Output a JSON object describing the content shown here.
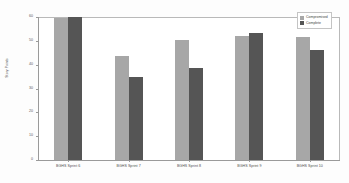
{
  "chart_data": {
    "type": "bar",
    "title": "",
    "subtitle": "",
    "xlabel": "",
    "ylabel": "Story Points",
    "ylim": [
      0,
      60
    ],
    "yticks": [
      0,
      10,
      20,
      30,
      40,
      50,
      60
    ],
    "ytick_labels": [
      "0",
      "10",
      "20",
      "30",
      "40",
      "50",
      "60"
    ],
    "grid": false,
    "legend_position": "upper-right",
    "categories": [
      "BGHS Sprint 6",
      "BGHS Sprint 7",
      "BGHS Sprint 8",
      "BGHS Sprint 9",
      "BGHS Sprint 10"
    ],
    "series": [
      {
        "name": "Compromised",
        "color": "#a7a7a7",
        "values": [
          59.5,
          43.5,
          50.5,
          52,
          51.5
        ]
      },
      {
        "name": "Complete",
        "color": "#555555",
        "values": [
          60,
          35,
          38.5,
          53.5,
          46
        ]
      }
    ]
  },
  "legend": {
    "entries": [
      {
        "label": "Compromised"
      },
      {
        "label": "Complete"
      }
    ]
  }
}
